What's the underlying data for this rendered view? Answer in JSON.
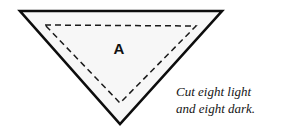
{
  "figure": {
    "name": "quilt-pattern-piece-a",
    "background_color": "#ffffff",
    "outer_triangle": {
      "name": "outer-cutting-triangle",
      "orientation": "inverted",
      "fill_color": "#f7f7f7",
      "stroke_color": "#0d0d0d",
      "stroke_width": 2.6,
      "points": "20,11 222,11 120,124"
    },
    "inner_triangle": {
      "name": "inner-seam-line-triangle",
      "orientation": "inverted",
      "fill_color": "none",
      "stroke_color": "#1a1a1a",
      "stroke_width": 1.5,
      "dash_pattern": "6,4",
      "points": "45,25 196,26 120,103"
    }
  },
  "label": {
    "piece_letter": "A"
  },
  "instructions": {
    "line_1": "Cut eight light",
    "line_2": "and eight dark."
  }
}
